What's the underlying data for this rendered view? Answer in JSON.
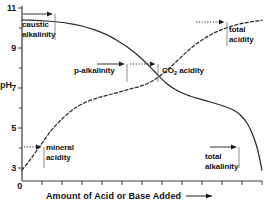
{
  "chart_data": {
    "type": "line",
    "title": "",
    "xlabel": "Amount of Acid or Base Added",
    "ylabel": "pH",
    "xlabel_suffix_icon": "right-arrow",
    "ylim": [
      0,
      11
    ],
    "ytick_labels": [
      "11",
      "9",
      "7",
      "5",
      "3",
      "0"
    ],
    "ytick_values": [
      11,
      9,
      7,
      5,
      3,
      0
    ],
    "xtick_count": 12,
    "xtick_labels": [],
    "grid": false,
    "legend": "none",
    "series": [
      {
        "name": "titration of base with acid (pH decreasing)",
        "style": "solid",
        "points": [
          [
            0.0,
            10.4
          ],
          [
            0.05,
            10.38
          ],
          [
            0.1,
            10.35
          ],
          [
            0.15,
            10.3
          ],
          [
            0.2,
            10.22
          ],
          [
            0.25,
            10.1
          ],
          [
            0.3,
            9.92
          ],
          [
            0.35,
            9.68
          ],
          [
            0.4,
            9.35
          ],
          [
            0.45,
            8.95
          ],
          [
            0.5,
            8.45
          ],
          [
            0.55,
            7.85
          ],
          [
            0.6,
            7.25
          ],
          [
            0.65,
            6.85
          ],
          [
            0.7,
            6.6
          ],
          [
            0.75,
            6.42
          ],
          [
            0.8,
            6.25
          ],
          [
            0.85,
            6.05
          ],
          [
            0.88,
            5.9
          ],
          [
            0.91,
            5.65
          ],
          [
            0.94,
            5.2
          ],
          [
            0.96,
            4.7
          ],
          [
            0.98,
            4.0
          ],
          [
            1.0,
            2.9
          ]
        ]
      },
      {
        "name": "titration of acid with base (pH increasing)",
        "style": "dashed",
        "points": [
          [
            0.0,
            2.9
          ],
          [
            0.03,
            3.35
          ],
          [
            0.06,
            3.85
          ],
          [
            0.09,
            4.35
          ],
          [
            0.12,
            4.85
          ],
          [
            0.15,
            5.25
          ],
          [
            0.18,
            5.6
          ],
          [
            0.21,
            5.9
          ],
          [
            0.25,
            6.2
          ],
          [
            0.3,
            6.45
          ],
          [
            0.35,
            6.62
          ],
          [
            0.4,
            6.78
          ],
          [
            0.45,
            6.95
          ],
          [
            0.5,
            7.12
          ],
          [
            0.55,
            7.4
          ],
          [
            0.6,
            7.85
          ],
          [
            0.65,
            8.4
          ],
          [
            0.7,
            8.95
          ],
          [
            0.75,
            9.4
          ],
          [
            0.8,
            9.75
          ],
          [
            0.85,
            10.0
          ],
          [
            0.9,
            10.18
          ],
          [
            0.95,
            10.3
          ],
          [
            1.0,
            10.38
          ]
        ]
      }
    ],
    "annotations": [
      {
        "id": "caustic-alkalinity",
        "label_line1": "caustic",
        "label_line2": "alkalinity",
        "arrow_style": "solid",
        "arrow_direction": "right",
        "ph_level": 10.35
      },
      {
        "id": "p-alkalinity",
        "label_line1": "p-alkalinity",
        "label_line2": "",
        "arrow_style": "solid",
        "arrow_direction": "right",
        "ph_level": 8.3
      },
      {
        "id": "co2-acidity",
        "label_line1": "CO2 acidity",
        "label_line2": "",
        "arrow_style": "dotted",
        "arrow_direction": "right",
        "ph_level": 8.3
      },
      {
        "id": "total-acidity",
        "label_line1": "total",
        "label_line2": "acidity",
        "arrow_style": "dotted",
        "arrow_direction": "right",
        "ph_level": 10.3
      },
      {
        "id": "mineral-acidity",
        "label_line1": "mineral",
        "label_line2": "acidity",
        "arrow_style": "dotted",
        "arrow_direction": "right",
        "ph_level": 4.45
      },
      {
        "id": "total-alkalinity",
        "label_line1": "total",
        "label_line2": "alkalinity",
        "arrow_style": "solid",
        "arrow_direction": "right",
        "ph_level": 4.45
      }
    ],
    "colors": {
      "axis": "#3a3a3a",
      "curve": "#2b2b2b",
      "text": "#121212",
      "background": "#ffffff"
    }
  },
  "annot_text": {
    "caustic_1": "caustic",
    "caustic_2": "alkalinity",
    "p_alkalinity": "p-alkalinity",
    "co2_prefix": "CO",
    "co2_sub": "2",
    "co2_suffix": " acidity",
    "total_acidity_1": "total",
    "total_acidity_2": "acidity",
    "mineral_1": "mineral",
    "mineral_2": "acidity",
    "total_alk_1": "total",
    "total_alk_2": "alkalinity"
  },
  "axis_text": {
    "y_name": "pH",
    "x_name": "Amount of Acid or Base Added",
    "y_11": "11",
    "y_9": "9",
    "y_7": "7",
    "y_5": "5",
    "y_3": "3",
    "y_0": "0"
  }
}
